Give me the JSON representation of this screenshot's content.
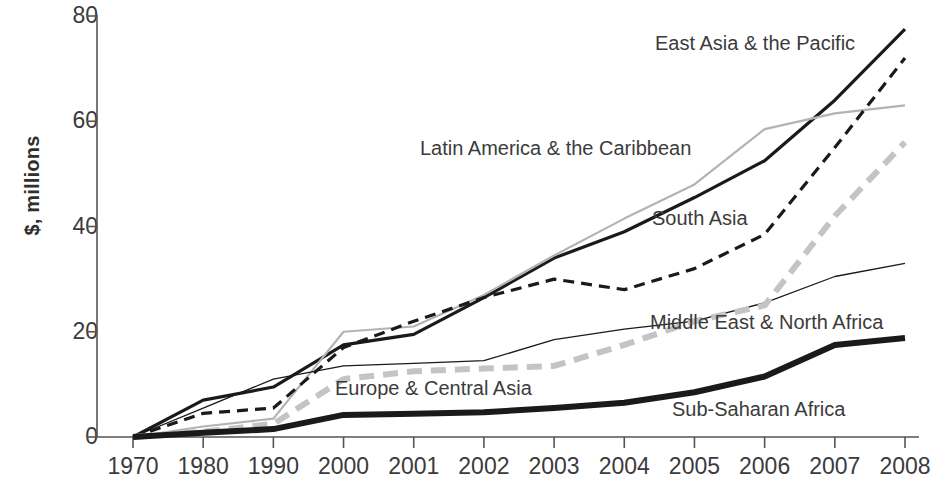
{
  "chart_data": {
    "type": "line",
    "title": "",
    "xlabel": "",
    "ylabel": "$, millions",
    "x": [
      "1970",
      "1980",
      "1990",
      "2000",
      "2001",
      "2002",
      "2003",
      "2004",
      "2005",
      "2006",
      "2007",
      "2008"
    ],
    "xtick_labels": [
      "1970",
      "1980",
      "1990",
      "2000",
      "2001",
      "2002",
      "2003",
      "2004",
      "2005",
      "2006",
      "2007",
      "2008"
    ],
    "ytick_labels": [
      "0",
      "20",
      "40",
      "60",
      "80"
    ],
    "yticks": [
      0,
      20,
      40,
      60,
      80
    ],
    "ylim": [
      0,
      80
    ],
    "grid": false,
    "legend_position": "inline-annotations",
    "series": [
      {
        "name": "East Asia & the Pacific",
        "style": "solid",
        "color": "#1a1a1a",
        "width": 3.2,
        "values": [
          0,
          7,
          9.5,
          17.5,
          19.5,
          26.5,
          34,
          39,
          45.5,
          52.5,
          64,
          77.5
        ],
        "label_x": 655,
        "label_y": 33
      },
      {
        "name": "Latin America & the Caribbean",
        "style": "solid",
        "color": "#b3b3b3",
        "width": 2.2,
        "values": [
          0,
          2,
          3.5,
          20,
          21,
          27,
          34.5,
          41.5,
          48,
          58.5,
          61.5,
          63
        ],
        "label_x": 420,
        "label_y": 138
      },
      {
        "name": "South Asia",
        "style": "dashed",
        "color": "#1a1a1a",
        "width": 3.2,
        "values": [
          0,
          4.5,
          5.5,
          17,
          22,
          26.5,
          30,
          28,
          32,
          38.5,
          55,
          72
        ],
        "label_x": 652,
        "label_y": 208
      },
      {
        "name": "Middle East & North Africa",
        "style": "solid",
        "color": "#1a1a1a",
        "width": 1.3,
        "values": [
          0,
          5.5,
          11,
          13.5,
          14,
          14.5,
          18.5,
          20.5,
          22,
          25.5,
          30.5,
          33
        ],
        "label_x": 650,
        "label_y": 312
      },
      {
        "name": "Europe & Central Asia",
        "style": "dashed-thick",
        "color": "#c4c4c4",
        "width": 6,
        "values": [
          0,
          1,
          2.5,
          11,
          12.5,
          13,
          13.5,
          17.5,
          22,
          25,
          42,
          56
        ],
        "label_x": 335,
        "label_y": 378
      },
      {
        "name": "Sub-Saharan Africa",
        "style": "solid",
        "color": "#1a1a1a",
        "width": 6,
        "values": [
          0,
          0.8,
          1.5,
          4.2,
          4.4,
          4.7,
          5.5,
          6.5,
          8.5,
          11.5,
          17.5,
          18.8
        ],
        "label_x": 672,
        "label_y": 399
      }
    ]
  },
  "axis": {
    "y_title": "$, millions"
  }
}
